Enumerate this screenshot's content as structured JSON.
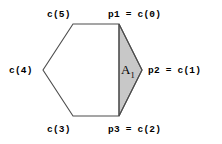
{
  "figure": {
    "type": "geometry-diagram",
    "background_color": "#ffffff",
    "stroke_color": "#4d4d4d",
    "shaded_fill_color": "#c8c8c8",
    "labels": {
      "top_left_vertex": "c(5)",
      "top_right_vertex": "p1 = c(0)",
      "left_vertex": "c(4)",
      "right_vertex": "p2 = c(1)",
      "bottom_left_vertex": "c(3)",
      "bottom_right_vertex": "p3 = c(2)",
      "shaded_region": "A",
      "shaded_region_subscript": "1"
    },
    "shape": {
      "hexagon_points": "73,24 119,24 142,70 119,116 73,116 43,70",
      "shaded_triangle_points": "119,24 142,70 119,116",
      "chord_start": "119,24",
      "chord_end": "119,116"
    }
  }
}
